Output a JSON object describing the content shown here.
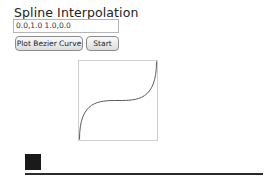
{
  "header": {
    "title": "Spline Interpolation"
  },
  "controls": {
    "points_input_value": "0.0,1.0 1.0,0.0",
    "plot_button_label": "Plot Bezier Curve",
    "start_button_label": "Start"
  },
  "curve": {
    "type": "cubic-bezier",
    "p0": [
      0.0,
      0.0
    ],
    "p1": [
      0.0,
      1.0
    ],
    "p2": [
      1.0,
      0.0
    ],
    "p3": [
      1.0,
      1.0
    ],
    "stroke_color": "#555555",
    "border_color": "#cfcfcf"
  },
  "animation": {
    "square_color": "#1a1a1a",
    "track_color": "#2a2a2a"
  }
}
